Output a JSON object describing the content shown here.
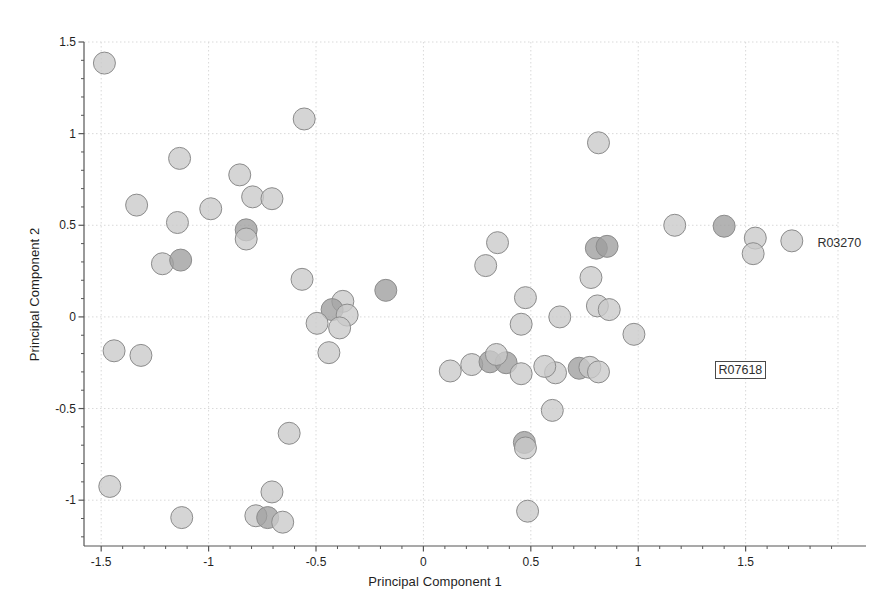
{
  "chart_data": {
    "type": "scatter",
    "title": "",
    "xlabel": "Principal Component 1",
    "ylabel": "Principal Component 2",
    "xlim": [
      -1.58,
      1.93
    ],
    "ylim": [
      -1.25,
      1.5
    ],
    "xticks": [
      -1.5,
      -1,
      -0.5,
      0,
      0.5,
      1,
      1.5
    ],
    "xtick_labels": [
      "-1.5",
      "-1",
      "-0.5",
      "0",
      "0.5",
      "1",
      "1.5"
    ],
    "yticks": [
      -1,
      -0.5,
      0,
      0.5,
      1,
      1.5
    ],
    "ytick_labels": [
      "-1",
      "-0.5",
      "0",
      "0.5",
      "1",
      "1.5"
    ],
    "xminor_step": 0.1,
    "yminor_step": 0.1,
    "grid": true,
    "grid_color": "#d9d9d9",
    "frame_color": "#555555",
    "marker_fill_light": "#c9c9c9",
    "marker_fill_dark": "#9e9e9e",
    "marker_edge": "#8c8c8c",
    "marker_radius": 11,
    "marker_opacity": 0.78,
    "legend": [],
    "annotations": [
      {
        "text": "R03270",
        "x": 1.82,
        "y": 0.405,
        "boxed": false
      },
      {
        "text": "R07618",
        "x": 1.355,
        "y": -0.29,
        "boxed": true
      }
    ],
    "points": [
      {
        "x": -1.485,
        "y": 1.385,
        "shade": "light"
      },
      {
        "x": -0.555,
        "y": 1.08,
        "shade": "light"
      },
      {
        "x": -1.135,
        "y": 0.865,
        "shade": "light"
      },
      {
        "x": -0.855,
        "y": 0.775,
        "shade": "light"
      },
      {
        "x": -0.795,
        "y": 0.655,
        "shade": "light"
      },
      {
        "x": -0.705,
        "y": 0.645,
        "shade": "light"
      },
      {
        "x": -1.335,
        "y": 0.61,
        "shade": "light"
      },
      {
        "x": -0.99,
        "y": 0.59,
        "shade": "light"
      },
      {
        "x": -1.145,
        "y": 0.515,
        "shade": "light"
      },
      {
        "x": -0.825,
        "y": 0.475,
        "shade": "dark"
      },
      {
        "x": -0.825,
        "y": 0.425,
        "shade": "light"
      },
      {
        "x": -1.215,
        "y": 0.29,
        "shade": "light"
      },
      {
        "x": -1.13,
        "y": 0.31,
        "shade": "dark"
      },
      {
        "x": -0.565,
        "y": 0.205,
        "shade": "light"
      },
      {
        "x": -0.175,
        "y": 0.145,
        "shade": "dark"
      },
      {
        "x": -0.375,
        "y": 0.085,
        "shade": "light"
      },
      {
        "x": -0.425,
        "y": 0.04,
        "shade": "dark"
      },
      {
        "x": -0.355,
        "y": 0.01,
        "shade": "light"
      },
      {
        "x": -0.495,
        "y": -0.035,
        "shade": "light"
      },
      {
        "x": -0.39,
        "y": -0.06,
        "shade": "light"
      },
      {
        "x": -0.44,
        "y": -0.195,
        "shade": "light"
      },
      {
        "x": -1.44,
        "y": -0.185,
        "shade": "light"
      },
      {
        "x": -1.315,
        "y": -0.21,
        "shade": "light"
      },
      {
        "x": -0.625,
        "y": -0.635,
        "shade": "light"
      },
      {
        "x": -1.46,
        "y": -0.925,
        "shade": "light"
      },
      {
        "x": -1.125,
        "y": -1.095,
        "shade": "light"
      },
      {
        "x": -0.705,
        "y": -0.955,
        "shade": "light"
      },
      {
        "x": -0.78,
        "y": -1.085,
        "shade": "light"
      },
      {
        "x": -0.725,
        "y": -1.095,
        "shade": "dark"
      },
      {
        "x": -0.655,
        "y": -1.12,
        "shade": "light"
      },
      {
        "x": 0.125,
        "y": -0.295,
        "shade": "light"
      },
      {
        "x": 0.225,
        "y": -0.26,
        "shade": "light"
      },
      {
        "x": 0.31,
        "y": -0.245,
        "shade": "dark"
      },
      {
        "x": 0.385,
        "y": -0.25,
        "shade": "dark"
      },
      {
        "x": 0.34,
        "y": -0.205,
        "shade": "light"
      },
      {
        "x": 0.345,
        "y": 0.405,
        "shade": "light"
      },
      {
        "x": 0.29,
        "y": 0.28,
        "shade": "light"
      },
      {
        "x": 0.475,
        "y": 0.105,
        "shade": "light"
      },
      {
        "x": 0.455,
        "y": -0.04,
        "shade": "light"
      },
      {
        "x": 0.455,
        "y": -0.31,
        "shade": "light"
      },
      {
        "x": 0.47,
        "y": -0.685,
        "shade": "dark"
      },
      {
        "x": 0.475,
        "y": -0.715,
        "shade": "light"
      },
      {
        "x": 0.485,
        "y": -1.06,
        "shade": "light"
      },
      {
        "x": 0.6,
        "y": -0.51,
        "shade": "light"
      },
      {
        "x": 0.615,
        "y": -0.305,
        "shade": "light"
      },
      {
        "x": 0.565,
        "y": -0.27,
        "shade": "light"
      },
      {
        "x": 0.725,
        "y": -0.28,
        "shade": "dark"
      },
      {
        "x": 0.775,
        "y": -0.275,
        "shade": "light"
      },
      {
        "x": 0.815,
        "y": -0.3,
        "shade": "light"
      },
      {
        "x": 0.635,
        "y": 0.0,
        "shade": "light"
      },
      {
        "x": 0.78,
        "y": 0.215,
        "shade": "light"
      },
      {
        "x": 0.81,
        "y": 0.06,
        "shade": "light"
      },
      {
        "x": 0.865,
        "y": 0.04,
        "shade": "light"
      },
      {
        "x": 0.805,
        "y": 0.375,
        "shade": "dark"
      },
      {
        "x": 0.855,
        "y": 0.385,
        "shade": "dark"
      },
      {
        "x": 0.815,
        "y": 0.95,
        "shade": "light"
      },
      {
        "x": 0.98,
        "y": -0.095,
        "shade": "light"
      },
      {
        "x": 1.17,
        "y": 0.5,
        "shade": "light"
      },
      {
        "x": 1.4,
        "y": 0.495,
        "shade": "dark"
      },
      {
        "x": 1.545,
        "y": 0.43,
        "shade": "light"
      },
      {
        "x": 1.535,
        "y": 0.345,
        "shade": "light"
      },
      {
        "x": 1.715,
        "y": 0.415,
        "shade": "light"
      }
    ]
  }
}
